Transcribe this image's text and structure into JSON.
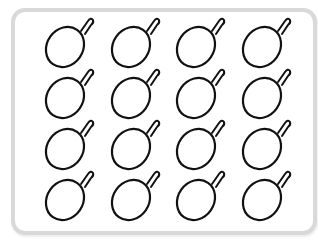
{
  "grid": {
    "rows": 4,
    "columns": 4,
    "count": 16
  },
  "item": {
    "icon": "fruit-outline-icon",
    "label": "fruit with stem outline"
  },
  "colors": {
    "stroke": "#111111",
    "frame": "#d9d9d9",
    "background": "#ffffff"
  }
}
